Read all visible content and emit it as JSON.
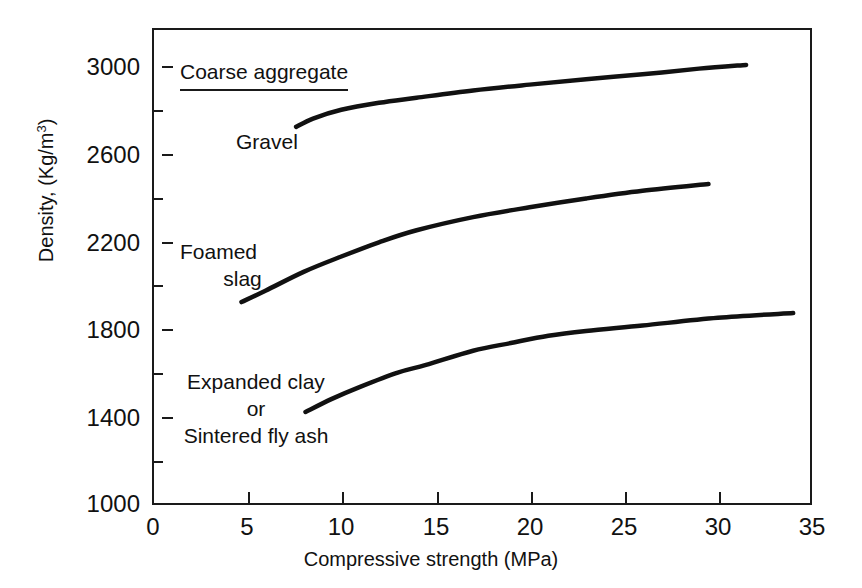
{
  "chart_data": {
    "type": "line",
    "title": "",
    "xlabel": "Compressive strength (MPa)",
    "ylabel": "Density, (Kg/m",
    "ylabel_sup": "3",
    "ylabel_tail": ")",
    "xlim": [
      0,
      35
    ],
    "ylim": [
      1000,
      3000
    ],
    "xticks": [
      0,
      5,
      10,
      15,
      20,
      25,
      30,
      35
    ],
    "xtick_labels": [
      "0",
      "5",
      "10",
      "15",
      "20",
      "25",
      "30",
      "35"
    ],
    "yticks": [
      1000,
      1400,
      1800,
      2200,
      2600,
      3000
    ],
    "ytick_labels": [
      "1000",
      "1400",
      "1800",
      "2200",
      "2600",
      "3000"
    ],
    "yticks_minor": [
      1200,
      1600,
      2000,
      2400,
      2800
    ],
    "grid": false,
    "legend_position": "in-plot annotations",
    "legend_title": "Coarse aggregate",
    "line_color": "#111111",
    "series": [
      {
        "name": "Gravel",
        "label_lines": [
          "Gravel"
        ],
        "x": [
          7.6,
          8.5,
          10.0,
          12.0,
          14.0,
          17.0,
          20.0,
          23.0,
          26.0,
          29.0,
          31.5
        ],
        "y": [
          2722,
          2760,
          2800,
          2832,
          2855,
          2888,
          2915,
          2940,
          2962,
          2988,
          3005
        ]
      },
      {
        "name": "Foamed slag",
        "label_lines": [
          "Foamed",
          "slag"
        ],
        "x": [
          4.7,
          6.0,
          8.0,
          10.0,
          12.0,
          14.0,
          17.0,
          20.0,
          23.0,
          26.0,
          29.5
        ],
        "y": [
          1922,
          1975,
          2060,
          2130,
          2195,
          2250,
          2310,
          2355,
          2395,
          2430,
          2461
        ]
      },
      {
        "name": "Expanded clay or Sintered fly ash",
        "label_lines": [
          "Expanded clay",
          "or",
          "Sintered fly ash"
        ],
        "x": [
          8.1,
          9.5,
          11.0,
          13.0,
          14.5,
          17.0,
          19.0,
          21.0,
          23.0,
          26.0,
          30.0,
          34.0
        ],
        "y": [
          1420,
          1480,
          1535,
          1600,
          1635,
          1700,
          1735,
          1768,
          1790,
          1815,
          1850,
          1872
        ]
      }
    ],
    "annotations": [
      {
        "id": "legend-title",
        "text": "Coarse aggregate",
        "underlined": true
      },
      {
        "id": "gravel-label",
        "text": "Gravel"
      },
      {
        "id": "foamed-slag-label",
        "text": "Foamed slag"
      },
      {
        "id": "expanded-clay-label",
        "text": "Expanded clay or Sintered fly ash"
      }
    ]
  },
  "labels": {
    "legend_title": "Coarse aggregate",
    "gravel": "Gravel",
    "foamed": "Foamed",
    "slag": "slag",
    "expanded_clay": "Expanded clay",
    "or": "or",
    "sintered": "Sintered fly ash",
    "xtitle": "Compressive strength (MPa)",
    "ytitle_main": "Density, (Kg/m",
    "ytitle_sup": "3",
    "ytitle_tail": ")"
  },
  "ytick_labels": {
    "t3000": "3000",
    "t2600": "2600",
    "t2200": "2200",
    "t1800": "1800",
    "t1400": "1400",
    "t1000": "1000"
  },
  "xtick_labels": {
    "t0": "0",
    "t5": "5",
    "t10": "10",
    "t15": "15",
    "t20": "20",
    "t25": "25",
    "t30": "30",
    "t35": "35"
  }
}
